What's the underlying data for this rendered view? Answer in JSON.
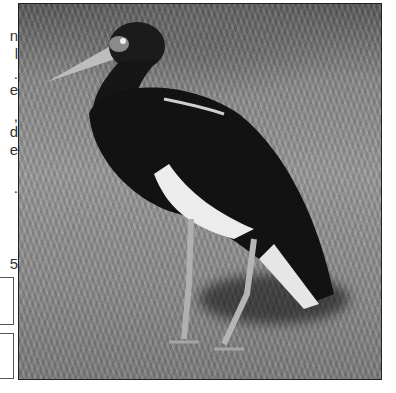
{
  "left_edge_fragments": [
    "n",
    "l",
    ".",
    "e",
    ",",
    "d",
    "e",
    ".",
    "5"
  ],
  "photo": {
    "subject": "stork standing on grass",
    "colors": {
      "background": "#8a8a8a",
      "bird_body": "#151515",
      "belly": "#eeeeee",
      "beak": "#bdbdbd"
    }
  }
}
